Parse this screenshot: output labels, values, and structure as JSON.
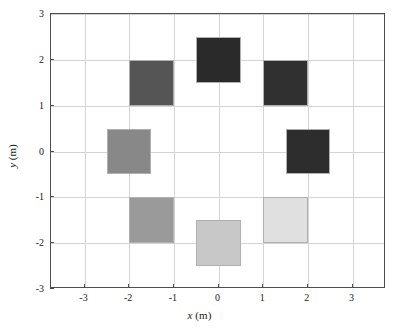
{
  "chart_data": {
    "type": "scatter",
    "title": "",
    "subtitle": "",
    "xlabel": "x (m)",
    "ylabel": "y (m)",
    "xlabel_var": "x",
    "xlabel_unit": "(m)",
    "ylabel_var": "y",
    "ylabel_unit": "(m)",
    "xlim": [
      -3.75,
      3.75
    ],
    "ylim": [
      -3,
      3
    ],
    "xticks": [
      -3,
      -2,
      -1,
      0,
      1,
      2,
      3
    ],
    "yticks": [
      -3,
      -2,
      -1,
      0,
      1,
      2,
      3
    ],
    "xticklabels": [
      "-3",
      "-2",
      "-1",
      "0",
      "1",
      "2",
      "3"
    ],
    "yticklabels": [
      "-3",
      "-2",
      "-1",
      "0",
      "1",
      "2",
      "3"
    ],
    "grid": true,
    "legend": "none",
    "marker": "square",
    "marker_size_m": 1.0,
    "background_color": "#ffffff",
    "axis_color": "#4d4d4d",
    "grid_color": "#d4d4d4",
    "patch_edge_color": "#b0b0b0",
    "series": [
      {
        "name": "grayscale squares",
        "points": [
          {
            "label": "top-center",
            "x": 0.0,
            "y": 2.0,
            "w": 1.0,
            "h": 1.0,
            "color": "#2a2a2a"
          },
          {
            "label": "upper-right",
            "x": 1.5,
            "y": 1.5,
            "w": 1.0,
            "h": 1.0,
            "color": "#303030"
          },
          {
            "label": "right-middle",
            "x": 2.0,
            "y": 0.0,
            "w": 1.0,
            "h": 1.0,
            "color": "#2d2d2d"
          },
          {
            "label": "lower-right",
            "x": 1.5,
            "y": -1.5,
            "w": 1.0,
            "h": 1.0,
            "color": "#e0e0e0"
          },
          {
            "label": "bottom-center",
            "x": 0.0,
            "y": -2.0,
            "w": 1.0,
            "h": 1.0,
            "color": "#c8c8c8"
          },
          {
            "label": "lower-left",
            "x": -1.5,
            "y": -1.5,
            "w": 1.0,
            "h": 1.0,
            "color": "#9a9a9a"
          },
          {
            "label": "left-middle",
            "x": -2.0,
            "y": 0.0,
            "w": 1.0,
            "h": 1.0,
            "color": "#888888"
          },
          {
            "label": "upper-left",
            "x": -1.5,
            "y": 1.5,
            "w": 1.0,
            "h": 1.0,
            "color": "#555555"
          }
        ]
      }
    ]
  }
}
